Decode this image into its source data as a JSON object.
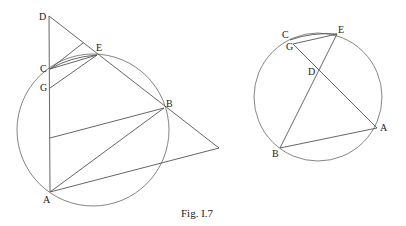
{
  "caption": "Fig. I.7",
  "left_figure": {
    "labels": {
      "D": "D",
      "E": "E",
      "C": "C",
      "G": "G",
      "B": "B",
      "A": "A"
    }
  },
  "right_figure": {
    "labels": {
      "C": "C",
      "G": "G",
      "E": "E",
      "D": "D",
      "A": "A",
      "B": "B"
    }
  }
}
